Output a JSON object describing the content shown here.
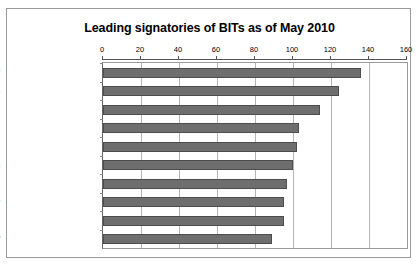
{
  "chart_data": {
    "type": "bar",
    "orientation": "horizontal",
    "title": "Leading signatories of BITs as of May 2010",
    "xlabel": "",
    "ylabel": "",
    "xlim": [
      0,
      160
    ],
    "xticks": [
      0,
      20,
      40,
      60,
      80,
      100,
      120,
      140,
      160
    ],
    "grid": true,
    "legend": false,
    "bar_color": "#6e6e6e",
    "bar_border_color": "#4d4d4d",
    "categories": [
      "Germany",
      "China",
      "Switzerland",
      "United Kingdom",
      "France",
      "Egypt",
      "Netherlands",
      "Italy",
      "Belgium and Luxembourg",
      "Korea, Republic of"
    ],
    "values": [
      136,
      124,
      114,
      103,
      102,
      100,
      97,
      95,
      95,
      89
    ]
  }
}
